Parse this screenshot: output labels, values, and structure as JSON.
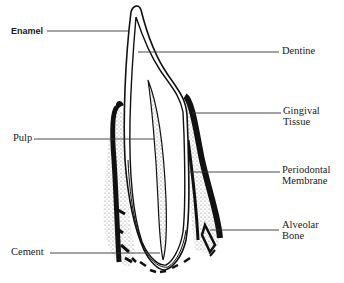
{
  "diagram": {
    "title": "",
    "labels": {
      "enamel": "Enamel",
      "dentine": "Dentine",
      "gingival_line1": "Gingival",
      "gingival_line2": "Tissue",
      "pulp": "Pulp",
      "periodontal_line1": "Periodontal",
      "periodontal_line2": "Membrane",
      "alveolar_line1": "Alveolar",
      "alveolar_line2": "Bone",
      "cement": "Cement"
    },
    "colors": {
      "ink": "#111111",
      "stipple": "#9a9a9a",
      "background": "#ffffff"
    }
  }
}
